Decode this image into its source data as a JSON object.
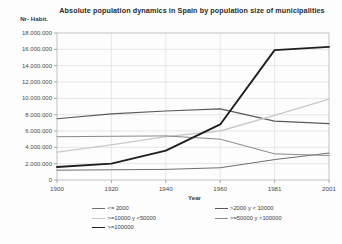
{
  "chart_data": {
    "type": "line",
    "title": "Absolute population dynamics in Spain by population size of municipalities",
    "xlabel": "Year",
    "ylabel": "Nr- Habit.",
    "grid": true,
    "legend_position": "bottom",
    "categories": [
      "1900",
      "1920",
      "1940",
      "1960",
      "1981",
      "2001"
    ],
    "x": [
      1900,
      1920,
      1940,
      1960,
      1981,
      2001
    ],
    "xlim": [
      1900,
      2001
    ],
    "ylim": [
      0,
      18000000
    ],
    "ytick_labels": [
      "18.000.000",
      "16.000.000",
      "14.000.000",
      "12.000.000",
      "10.000.000",
      "8.000.000",
      "6.000.000",
      "4.000.000",
      "2.000.000",
      "0"
    ],
    "ytick_values": [
      18000000,
      16000000,
      14000000,
      12000000,
      10000000,
      8000000,
      6000000,
      4000000,
      2000000,
      0
    ],
    "series": [
      {
        "name": "<= 2000",
        "color": "#6e6e6e",
        "width": 1.0,
        "values": [
          1200000,
          1250000,
          1300000,
          1500000,
          2500000,
          3300000
        ]
      },
      {
        "name": ">2000 y < 10000",
        "color": "#5a5a5a",
        "width": 1.2,
        "values": [
          7500000,
          8100000,
          8450000,
          8700000,
          7200000,
          6900000
        ]
      },
      {
        "name": ">=10000 y <50000",
        "color": "#c8c8c8",
        "width": 1.3,
        "values": [
          3400000,
          4300000,
          5300000,
          6000000,
          7900000,
          9900000
        ]
      },
      {
        "name": ">=50000 y <100000",
        "color": "#8a8a8a",
        "width": 1.0,
        "values": [
          5300000,
          5350000,
          5400000,
          5000000,
          3200000,
          3000000
        ]
      },
      {
        "name": ">=100000",
        "color": "#1f1f1f",
        "width": 1.9,
        "values": [
          1600000,
          2000000,
          3600000,
          6800000,
          15900000,
          16300000
        ]
      }
    ]
  }
}
